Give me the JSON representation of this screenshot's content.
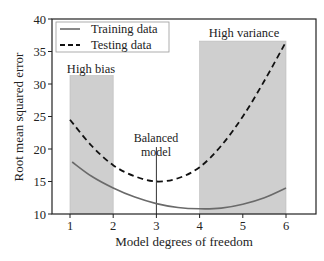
{
  "chart_data": {
    "type": "line",
    "title": "",
    "xlabel": "Model degrees of freedom",
    "ylabel": "Root mean squared error",
    "xlim": [
      0.7,
      6.7
    ],
    "ylim": [
      10,
      40
    ],
    "xticks": [
      1,
      2,
      3,
      4,
      5,
      6
    ],
    "yticks": [
      10,
      15,
      20,
      25,
      30,
      35,
      40
    ],
    "grid": false,
    "legend_position": "upper left",
    "legend": [
      "Training data",
      "Testing data"
    ],
    "series": [
      {
        "name": "Training data",
        "style": "solid",
        "color": "#666666",
        "x": [
          1.05,
          1.5,
          2,
          2.5,
          3,
          3.5,
          4,
          4.5,
          5,
          5.5,
          6
        ],
        "y": [
          18.0,
          15.8,
          14.0,
          12.6,
          11.6,
          11.0,
          10.8,
          10.9,
          11.5,
          12.5,
          14.0
        ]
      },
      {
        "name": "Testing data",
        "style": "dashed",
        "color": "#111111",
        "x": [
          1.0,
          1.5,
          2,
          2.5,
          3,
          3.5,
          4,
          4.5,
          5,
          5.5,
          6
        ],
        "y": [
          24.5,
          20.5,
          17.5,
          15.8,
          15.0,
          15.5,
          17.2,
          20.5,
          25.0,
          30.5,
          36.5
        ]
      }
    ],
    "shaded_regions": [
      {
        "label": "High bias",
        "x": [
          1,
          2
        ],
        "y": [
          10,
          31.3
        ],
        "color": "#cfcfcf"
      },
      {
        "label": "High variance",
        "x": [
          4,
          6
        ],
        "y": [
          10,
          36.6
        ],
        "color": "#cfcfcf"
      }
    ],
    "annotations": [
      {
        "text": "High bias",
        "x": 1.5,
        "y": 32.3
      },
      {
        "text": "High variance",
        "x": 5,
        "y": 37.5
      },
      {
        "text": "Balanced model",
        "x": 3,
        "y": 21.5,
        "line_x": 3,
        "line_y": [
          10,
          20.3
        ]
      }
    ]
  },
  "labels": {
    "xlabel": "Model degrees of freedom",
    "ylabel": "Root mean squared error",
    "legend_training": "Training data",
    "legend_testing": "Testing data",
    "high_bias": "High bias",
    "high_variance": "High variance",
    "balanced_line1": "Balanced",
    "balanced_line2": "model",
    "xticks": [
      "1",
      "2",
      "3",
      "4",
      "5",
      "6"
    ],
    "yticks": [
      "10",
      "15",
      "20",
      "25",
      "30",
      "35",
      "40"
    ]
  }
}
